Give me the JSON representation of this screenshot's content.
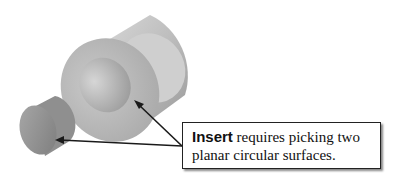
{
  "callout": {
    "keyword": "Insert",
    "text": " requires picking two planar circular surfaces."
  },
  "figure": {
    "arrow_color": "#1a1a1a"
  }
}
